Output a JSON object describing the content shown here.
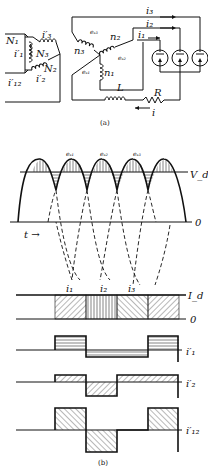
{
  "figure": {
    "part_a": {
      "caption": "(a)",
      "primary": {
        "windings": [
          "N1",
          "N2",
          "N3"
        ],
        "currents": [
          "i'1",
          "i'2",
          "i'3",
          "i'12"
        ]
      },
      "secondary": {
        "windings": [
          "n1",
          "n2",
          "n3"
        ],
        "emfs": [
          "eS1",
          "eS2",
          "eS3"
        ],
        "currents": [
          "i1",
          "i2",
          "i3",
          "i"
        ],
        "inductor": "L",
        "resistor": "R",
        "tubes": 3
      },
      "labels": {
        "N1": "N₁",
        "N2": "N₂",
        "N3": "N₃",
        "ip1": "i′₁",
        "ip2": "i′₂",
        "ip3": "i′₃",
        "ip12": "i′₁₂",
        "n1": "n₁",
        "n2": "n₂",
        "n3": "n₃",
        "es1": "eₛ₁",
        "es2": "eₛ₂",
        "es3": "eₛ₃",
        "i1": "i₁",
        "i2": "i₂",
        "i3": "i₃",
        "i": "i",
        "L": "L",
        "R": "R"
      }
    },
    "part_b": {
      "caption": "(b)",
      "voltage_plot": {
        "curves": [
          "es1",
          "es2",
          "es3"
        ],
        "labels": {
          "es1": "eₛ₁",
          "es2": "eₛ₂",
          "es3": "eₛ₃",
          "vd": "V_d",
          "zero": "0",
          "time": "t →"
        }
      },
      "current_plots": {
        "labels": {
          "i1": "i₁",
          "i2": "i₂",
          "i3": "i₃",
          "Id": "I_d",
          "zero": "0",
          "ip1": "i′₁",
          "ip2": "i′₂",
          "ip12": "i′₁₂"
        }
      }
    }
  }
}
